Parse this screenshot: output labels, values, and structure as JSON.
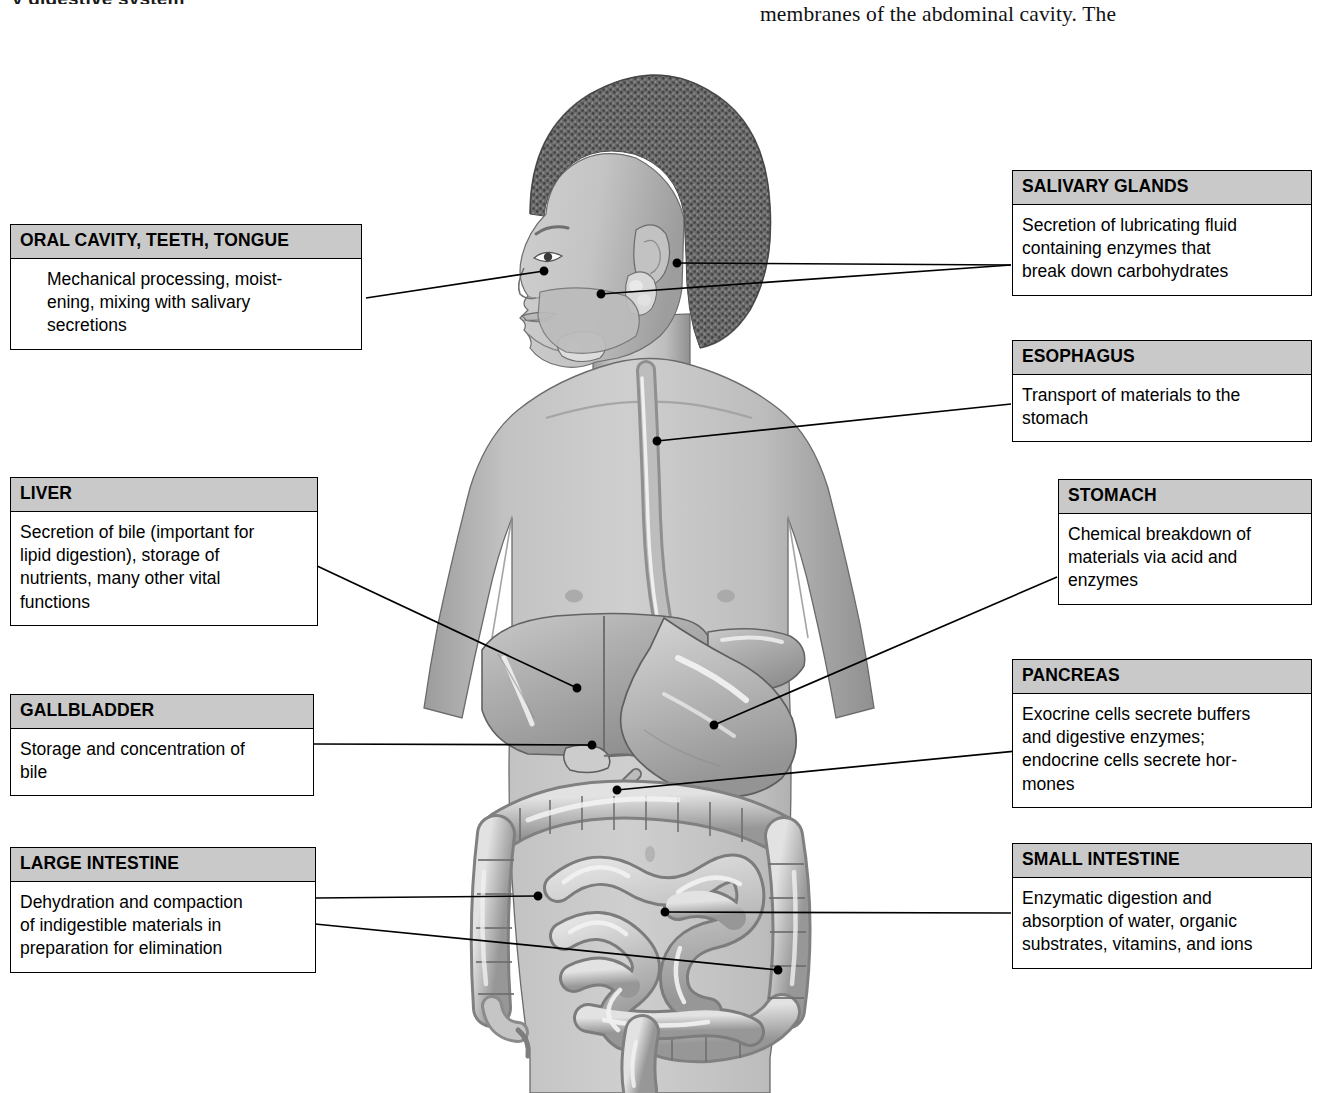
{
  "page": {
    "running_head_fragment": "y digestive system",
    "body_text_fragment": "membranes of the abdominal cavity. The",
    "background_color": "#ffffff",
    "header_fill_color": "#c9c9c9",
    "border_color": "#000000",
    "leader_line_color": "#000000"
  },
  "figure": {
    "organs": [
      "oral cavity",
      "salivary glands",
      "esophagus",
      "stomach",
      "liver",
      "gallbladder",
      "pancreas",
      "small intestine",
      "large intestine",
      "rectum"
    ]
  },
  "callouts": {
    "oral_cavity": {
      "title": "ORAL CAVITY, TEETH, TONGUE",
      "body": "Mechanical processing, moist-\nening, mixing with salivary\nsecretions"
    },
    "liver": {
      "title": "LIVER",
      "body": "Secretion of bile (important for\nlipid digestion), storage of\nnutrients, many other vital\nfunctions"
    },
    "gallbladder": {
      "title": "GALLBLADDER",
      "body": "Storage and concentration of\nbile"
    },
    "large_intestine": {
      "title": "LARGE INTESTINE",
      "body": "Dehydration and compaction\nof indigestible materials in\npreparation for elimination"
    },
    "salivary_glands": {
      "title": "SALIVARY GLANDS",
      "body": "Secretion of lubricating fluid\ncontaining enzymes that\nbreak down carbohydrates"
    },
    "esophagus": {
      "title": "ESOPHAGUS",
      "body": "Transport of materials to the\nstomach"
    },
    "stomach": {
      "title": "STOMACH",
      "body": "Chemical breakdown of\nmaterials via acid and\nenzymes"
    },
    "pancreas": {
      "title": "PANCREAS",
      "body": "Exocrine cells secrete buffers\nand digestive enzymes;\nendocrine cells secrete hor-\nmones"
    },
    "small_intestine": {
      "title": "SMALL INTESTINE",
      "body": "Enzymatic digestion and\nabsorption of water, organic\nsubstrates, vitamins, and ions"
    }
  }
}
